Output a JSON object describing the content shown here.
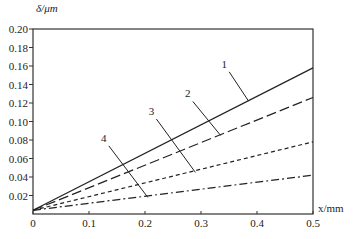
{
  "chart_data": {
    "type": "line",
    "title": "",
    "xlabel": "x/mm",
    "ylabel": "δ/μm",
    "xlim": [
      0,
      0.5
    ],
    "ylim": [
      0,
      0.2
    ],
    "grid": false,
    "legend": "inline numbered labels with leader lines",
    "x_ticks": [
      "0",
      "0.1",
      "0.2",
      "0.3",
      "0.4",
      "0.5"
    ],
    "y_ticks": [
      "0.02",
      "0.04",
      "0.06",
      "0.08",
      "0.10",
      "0.12",
      "0.14",
      "0.16",
      "0.18",
      "0.20"
    ],
    "x": [
      0,
      0.5
    ],
    "series": [
      {
        "name": "1",
        "style": "solid",
        "values": [
          0.004,
          0.158
        ]
      },
      {
        "name": "2",
        "style": "long-dash",
        "values": [
          0.004,
          0.126
        ]
      },
      {
        "name": "3",
        "style": "short-dash",
        "values": [
          0.004,
          0.078
        ]
      },
      {
        "name": "4",
        "style": "dash-dot",
        "values": [
          0.004,
          0.042
        ]
      }
    ],
    "annotations": [
      {
        "text": "1",
        "label_pos": [
          0.345,
          0.158
        ],
        "points_to": [
          0.385,
          0.122
        ]
      },
      {
        "text": "2",
        "label_pos": [
          0.28,
          0.126
        ],
        "points_to": [
          0.335,
          0.085
        ]
      },
      {
        "text": "3",
        "label_pos": [
          0.215,
          0.107
        ],
        "points_to": [
          0.29,
          0.045
        ]
      },
      {
        "text": "4",
        "label_pos": [
          0.13,
          0.078
        ],
        "points_to": [
          0.205,
          0.018
        ]
      }
    ]
  }
}
